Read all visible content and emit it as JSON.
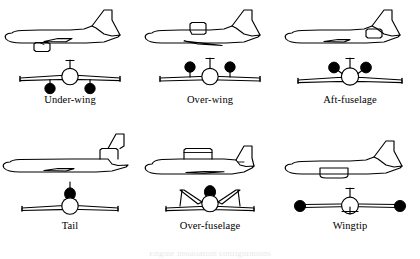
{
  "figure": {
    "title": "Engine installation configurations",
    "background_color": "#ffffff",
    "line_color": "#000000",
    "engine_fill_color": "#000000",
    "fuselage_fill_color": "#ffffff",
    "rows": 2,
    "columns": 3
  },
  "cells": [
    {
      "id": "under-wing",
      "label": "Under-wing",
      "row": 0,
      "column": 0,
      "side_view": "airliner-with-underwing-nacelle",
      "front_view": "front-view-engines-below-wing",
      "engine_count": 2,
      "engine_position": "below wing on pylons"
    },
    {
      "id": "over-wing",
      "label": "Over-wing",
      "row": 0,
      "column": 1,
      "side_view": "airliner-with-overwing-nacelle",
      "front_view": "front-view-engines-above-wing",
      "engine_count": 2,
      "engine_position": "above wing on pylons"
    },
    {
      "id": "aft-fuselage",
      "label": "Aft-fuselage",
      "row": 0,
      "column": 2,
      "side_view": "airliner-with-rear-fuselage-nacelle",
      "front_view": "front-view-engines-on-rear-fuselage",
      "engine_count": 2,
      "engine_position": "sides of rear fuselage"
    },
    {
      "id": "tail",
      "label": "Tail",
      "row": 1,
      "column": 0,
      "side_view": "airliner-with-tail-mounted-engine",
      "front_view": "front-view-engine-on-tail",
      "engine_count": 1,
      "engine_position": "on top of fuselage at tail"
    },
    {
      "id": "over-fuselage",
      "label": "Over-fuselage",
      "row": 1,
      "column": 1,
      "side_view": "airliner-with-dorsal-engine",
      "front_view": "front-view-engine-above-fuselage-braced-wing",
      "engine_count": 1,
      "engine_position": "above fuselage"
    },
    {
      "id": "wingtip",
      "label": "Wingtip",
      "row": 1,
      "column": 2,
      "side_view": "airliner-with-clean-wing",
      "front_view": "front-view-engines-at-wingtips",
      "engine_count": 2,
      "engine_position": "at wing tips"
    }
  ]
}
